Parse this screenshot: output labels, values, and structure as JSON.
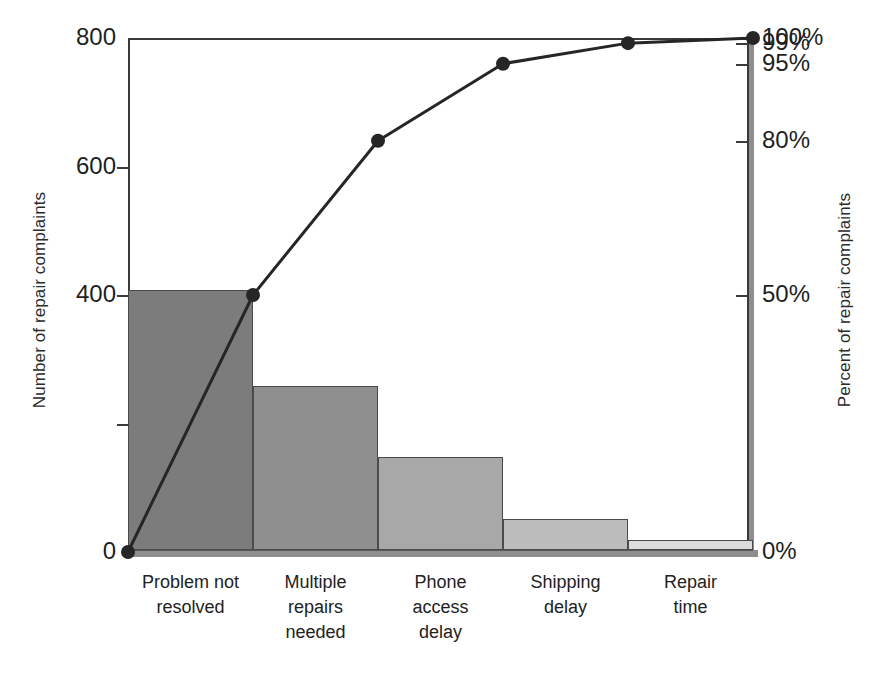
{
  "chart_data": {
    "type": "bar",
    "title": "",
    "subtitle": "",
    "categories": [
      "Problem not\nresolved",
      "Multiple\nrepairs\nneeded",
      "Phone\naccess\ndelay",
      "Shipping\ndelay",
      "Repair\ntime"
    ],
    "values": [
      404,
      256,
      145,
      48,
      16
    ],
    "cumulative_percent": [
      0,
      50,
      80,
      95,
      99,
      100
    ],
    "series": [
      {
        "name": "Number of repair complaints",
        "type": "bar",
        "values": [
          404,
          256,
          145,
          48,
          16
        ]
      },
      {
        "name": "Percent of repair complaints",
        "type": "line",
        "values": [
          50,
          80,
          95,
          99,
          100
        ]
      }
    ],
    "xlabel": "",
    "ylabel": "Number of repair complaints",
    "y2label": "Percent of repair complaints",
    "ylim": [
      0,
      800
    ],
    "y2lim": [
      0,
      100
    ],
    "yticks": [
      0,
      200,
      400,
      600,
      800
    ],
    "ytick_labels": [
      "0",
      "",
      "400",
      "600",
      "800"
    ],
    "y2ticks": [
      0,
      50,
      80,
      95,
      99,
      100
    ],
    "y2tick_labels": [
      "0%",
      "50%",
      "80%",
      "95%",
      "99%",
      "100%"
    ],
    "grid": false,
    "legend": "none",
    "line_origin_percent": 0,
    "bar_colors": [
      "#7c7c7c",
      "#8f8f8f",
      "#a8a8a8",
      "#bcbcbc",
      "#dcdcdc"
    ],
    "line_color": "#262626",
    "marker_color": "#262626"
  },
  "axes": {
    "left_title": "Number of repair complaints",
    "right_title": "Percent of repair complaints",
    "left_ticks": [
      {
        "label": "800",
        "value": 800
      },
      {
        "label": "600",
        "value": 600
      },
      {
        "label": "400",
        "value": 400
      },
      {
        "label": "0",
        "value": 0
      }
    ],
    "left_minor_ticks": [
      200
    ],
    "right_ticks": [
      {
        "label": "100%",
        "value": 100
      },
      {
        "label": "99%",
        "value": 99
      },
      {
        "label": "95%",
        "value": 95
      },
      {
        "label": "80%",
        "value": 80
      },
      {
        "label": "50%",
        "value": 50
      },
      {
        "label": "0%",
        "value": 0
      }
    ]
  },
  "categories_display": [
    [
      "Problem not",
      "resolved"
    ],
    [
      "Multiple",
      "repairs",
      "needed"
    ],
    [
      "Phone",
      "access",
      "delay"
    ],
    [
      "Shipping",
      "delay"
    ],
    [
      "Repair",
      "time"
    ]
  ]
}
